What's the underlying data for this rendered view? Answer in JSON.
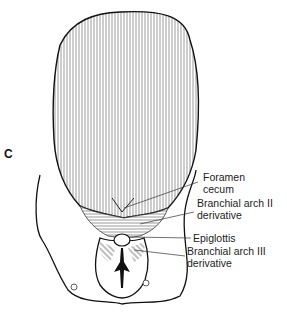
{
  "figure": {
    "panel_letter": "C",
    "labels": [
      {
        "id": "foramen-cecum",
        "line1": "Foramen",
        "line2": "cecum"
      },
      {
        "id": "branchial-arch-ii",
        "line1": "Branchial arch II",
        "line2": "derivative"
      },
      {
        "id": "epiglottis",
        "line1": "Epiglottis",
        "line2": ""
      },
      {
        "id": "branchial-arch-iii",
        "line1": "Branchial arch III",
        "line2": "derivative"
      }
    ],
    "colors": {
      "ink": "#111111",
      "background": "#ffffff"
    }
  }
}
